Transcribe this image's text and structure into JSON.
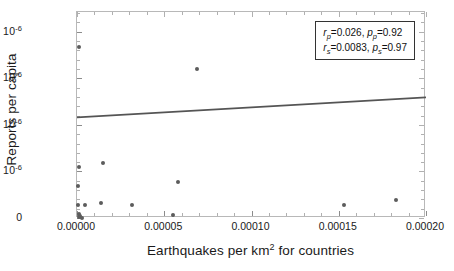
{
  "chart_data": {
    "type": "scatter",
    "title": "",
    "xlabel": "Earthquakes per km2 for countries",
    "xlabel_base": "Earthquakes per km",
    "xlabel_exp": "2",
    "xlabel_tail": " for countries",
    "ylabel": "Reports per capita",
    "xlim": [
      0.0,
      0.0002
    ],
    "ylim": [
      0.0,
      8.85e-06
    ],
    "grid": false,
    "legend_position": "top-right",
    "xticks": [
      0.0,
      5e-05,
      0.0001,
      0.00015,
      0.0002
    ],
    "xtick_labels": [
      "0.00000",
      "0.00005",
      "0.00010",
      "0.00015",
      "0.00020"
    ],
    "yticks": [
      0.0,
      2e-06,
      4e-06,
      6e-06,
      8e-06
    ],
    "ytick_labels": [
      "0",
      "2. × 10−6",
      "4. × 10−6",
      "6. × 10−6",
      "8. × 10−6"
    ],
    "ytick_mantissas": [
      "0",
      "2.",
      "4.",
      "6.",
      "8."
    ],
    "ytick_exponent": "-6",
    "points": [
      {
        "x": 1e-06,
        "y": 7.33e-06
      },
      {
        "x": 6.9e-05,
        "y": 6.42e-06
      },
      {
        "x": 1e-06,
        "y": 2.18e-06
      },
      {
        "x": 1.5e-05,
        "y": 2.38e-06
      },
      {
        "x": 5.8e-05,
        "y": 1.55e-06
      },
      {
        "x": 5e-07,
        "y": 1.36e-06
      },
      {
        "x": 5e-07,
        "y": 5.5e-07
      },
      {
        "x": 4.5e-06,
        "y": 5.7e-07
      },
      {
        "x": 1.35e-05,
        "y": 6.4e-07
      },
      {
        "x": 3.15e-05,
        "y": 5.5e-07
      },
      {
        "x": 0.000153,
        "y": 5.6e-07
      },
      {
        "x": 0.000183,
        "y": 7.6e-07
      },
      {
        "x": 5.5e-05,
        "y": 1.3e-07
      },
      {
        "x": 1e-06,
        "y": 1.8e-07
      },
      {
        "x": 2e-06,
        "y": 1e-07
      },
      {
        "x": 1.2e-06,
        "y": 5e-08
      },
      {
        "x": 3e-06,
        "y": 2e-08
      }
    ],
    "fit_line": {
      "x0": 0.0,
      "y0": 4.32e-06,
      "x1": 0.0002,
      "y1": 5.18e-06,
      "color": "#555555"
    },
    "marker_color": "#5c5c5c"
  },
  "legend": {
    "line1": {
      "stat_symbol": "r",
      "stat_sub": "p",
      "stat_value": "=0.026,",
      "p_symbol": "p",
      "p_sub": "p",
      "p_value": "=0.92"
    },
    "line2": {
      "stat_symbol": "r",
      "stat_sub": "s",
      "stat_value": "=0.0083,",
      "p_symbol": "p",
      "p_sub": "s",
      "p_value": "=0.97"
    }
  },
  "colors": {
    "frame": "#b8b8b8",
    "marker": "#5c5c5c",
    "fit_line": "#555555",
    "text": "#1a1a1a",
    "legend_border": "#333333"
  }
}
